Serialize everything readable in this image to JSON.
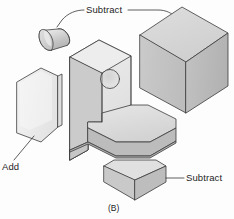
{
  "figure": {
    "caption": "(B)",
    "background_color": "#fdfdfd",
    "line_color": "#3b3b3b",
    "text_color": "#1d1d1d",
    "labels": {
      "subtract_top": "Subtract",
      "add_left": "Add",
      "subtract_bottom": "Subtract"
    },
    "shading": {
      "face_top_light": "#e4e4e4",
      "face_light": "#efefef",
      "face_medium": "#cfcfcf",
      "face_dark": "#bdbdbd",
      "face_darker": "#adadad",
      "cube_top": "#d8d8d8",
      "cube_left": "#c6c6c6",
      "cube_right": "#bcbcbc",
      "plate_face": "#ececec",
      "plate_edge": "#d2d2d2",
      "cylinder_body": "#d4d4d4",
      "cylinder_cap": "#c9c9c9",
      "dimple": "#dedede"
    },
    "parts": [
      {
        "name": "cylinder",
        "operation": "Subtract",
        "description": "tilted cylindrical plug used to cut the hole in the vertical wall",
        "position": "upper-left"
      },
      {
        "name": "cube",
        "operation": "Subtract",
        "description": "large isometric cube removed from the upper-right of the base block",
        "position": "upper-right"
      },
      {
        "name": "plate",
        "operation": "Add",
        "description": "flat hexagonal plate with chamfered top and bottom corners",
        "position": "left"
      },
      {
        "name": "wedge",
        "operation": "Subtract",
        "description": "small chamfered corner block removed from the base",
        "position": "bottom-center"
      },
      {
        "name": "l-bracket",
        "operation": "Base solid",
        "description": "central L-shaped bracket with circular dimple on the vertical face and chamfered base corners",
        "position": "center"
      }
    ]
  }
}
